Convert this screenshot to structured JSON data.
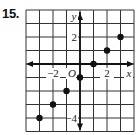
{
  "problem": {
    "number": "15."
  },
  "colors": {
    "grid": "#333333",
    "axis": "#111111",
    "point": "#111111",
    "background": "#ffffff"
  },
  "chart_data": {
    "type": "scatter",
    "title": "",
    "xlabel": "x",
    "ylabel": "y",
    "origin_label": "O",
    "xlim": [
      -4,
      4
    ],
    "ylim": [
      -5,
      4
    ],
    "grid": true,
    "x_tick_labels": [
      {
        "value": -2,
        "label": "−2"
      },
      {
        "value": 2,
        "label": "2"
      }
    ],
    "y_tick_labels": [
      {
        "value": 2,
        "label": "2"
      },
      {
        "value": -4,
        "label": "−4"
      }
    ],
    "points": [
      {
        "x": -3,
        "y": -4
      },
      {
        "x": -2,
        "y": -3
      },
      {
        "x": -1,
        "y": -2
      },
      {
        "x": 0,
        "y": -1
      },
      {
        "x": 1,
        "y": 0
      },
      {
        "x": 2,
        "y": 1
      },
      {
        "x": 3,
        "y": 2
      }
    ]
  }
}
